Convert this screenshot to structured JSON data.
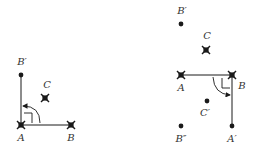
{
  "colors": {
    "ink": "#1a1a1a",
    "label": "#333333",
    "background": "#ffffff"
  },
  "left_figure": {
    "points": {
      "A": {
        "label": "A",
        "marker": "cross-square",
        "x": 21,
        "y": 125,
        "label_x": 21,
        "label_y": 141
      },
      "B": {
        "label": "B",
        "marker": "cross-square",
        "x": 71,
        "y": 125,
        "label_x": 71,
        "label_y": 141
      },
      "Bp": {
        "label": "B′",
        "marker": "dot",
        "x": 21,
        "y": 75,
        "label_x": 22,
        "label_y": 65
      },
      "C": {
        "label": "C",
        "marker": "cross-square",
        "x": 45,
        "y": 98,
        "label_x": 47,
        "label_y": 88
      }
    },
    "segments": [
      [
        "A",
        "B"
      ],
      [
        "A",
        "Bp"
      ]
    ],
    "rotation_arc": "counterclockwise 90° from AB to AB′",
    "right_angle_at": "A"
  },
  "right_figure": {
    "points": {
      "A": {
        "label": "A",
        "marker": "cross-square",
        "x": 181,
        "y": 75,
        "label_x": 181,
        "label_y": 91
      },
      "B": {
        "label": "B",
        "marker": "cross-square",
        "x": 232,
        "y": 75,
        "label_x": 242,
        "label_y": 89
      },
      "Bp": {
        "label": "B′",
        "marker": "dot",
        "x": 181,
        "y": 24,
        "label_x": 182,
        "label_y": 14
      },
      "C": {
        "label": "C",
        "marker": "cross-square",
        "x": 206,
        "y": 50,
        "label_x": 207,
        "label_y": 39
      },
      "Cp": {
        "label": "C′",
        "marker": "dot",
        "x": 207,
        "y": 101,
        "label_x": 205,
        "label_y": 116
      },
      "Bpp": {
        "label": "B″",
        "marker": "dot",
        "x": 181,
        "y": 126,
        "label_x": 181,
        "label_y": 142
      },
      "Ap": {
        "label": "A′",
        "marker": "dot",
        "x": 232,
        "y": 126,
        "label_x": 232,
        "label_y": 142
      }
    },
    "segments": [
      [
        "A",
        "B"
      ],
      [
        "B",
        "Ap"
      ]
    ],
    "rotation_arc": "clockwise 90° from BA to BA′",
    "right_angle_at": "B"
  }
}
